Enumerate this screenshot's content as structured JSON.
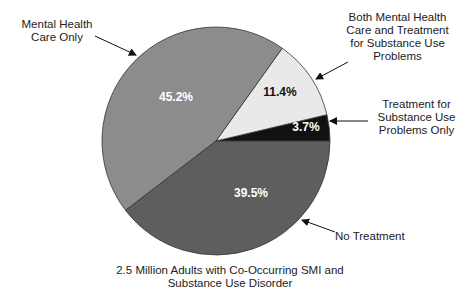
{
  "chart_data": {
    "type": "pie",
    "title": "",
    "caption_line1": "2.5 Million Adults with Co-Occurring SMI and",
    "caption_line2": "Substance Use Disorder",
    "slices": [
      {
        "key": "substance_only",
        "label": "Treatment for Substance Use Problems Only",
        "label_lines": [
          "Treatment for",
          "Substance Use",
          "Problems Only"
        ],
        "value": 3.7,
        "value_label": "3.7%",
        "color": "#111111",
        "text_color": "#ffffff"
      },
      {
        "key": "both",
        "label": "Both Mental Health Care and Treatment for Substance Use Problems",
        "label_lines": [
          "Both Mental Health",
          "Care and Treatment",
          "for Substance Use",
          "Problems"
        ],
        "value": 11.4,
        "value_label": "11.4%",
        "color": "#e9e9e9",
        "text_color": "#111111"
      },
      {
        "key": "mh_only",
        "label": "Mental Health Care Only",
        "label_lines": [
          "Mental Health",
          "Care Only"
        ],
        "value": 45.2,
        "value_label": "45.2%",
        "color": "#8c8c8c",
        "text_color": "#ffffff"
      },
      {
        "key": "no_treatment",
        "label": "No Treatment",
        "label_lines": [
          "No Treatment"
        ],
        "value": 39.5,
        "value_label": "39.5%",
        "color": "#5e5e5e",
        "text_color": "#ffffff"
      }
    ],
    "start_angle_deg": 0,
    "direction": "counterclockwise",
    "legend": "callout labels with arrows"
  }
}
